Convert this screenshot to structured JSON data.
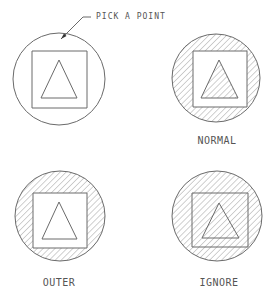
{
  "callout": {
    "text": "PICK A POINT",
    "leader": {
      "text_anchor": [
        96,
        19
      ],
      "elbow": [
        83,
        17
      ],
      "start": [
        91,
        17
      ],
      "tip": [
        61,
        39
      ]
    }
  },
  "panels": [
    {
      "id": "pick",
      "label": "",
      "circle": {
        "cx": 59,
        "cy": 79,
        "r": 46
      },
      "square": {
        "x": 32,
        "y": 51,
        "w": 55,
        "h": 57
      },
      "triangle": [
        [
          59,
          60
        ],
        [
          41,
          98
        ],
        [
          77,
          98
        ]
      ],
      "hatch": "none"
    },
    {
      "id": "normal",
      "label": "NORMAL",
      "label_pos": [
        217,
        144
      ],
      "circle": {
        "cx": 216,
        "cy": 78,
        "r": 44
      },
      "square": {
        "x": 193,
        "y": 51,
        "w": 54,
        "h": 56
      },
      "triangle": [
        [
          219,
          60
        ],
        [
          201,
          98
        ],
        [
          238,
          98
        ]
      ],
      "hatch": "normal"
    },
    {
      "id": "outer",
      "label": "OUTER",
      "label_pos": [
        59,
        286
      ],
      "circle": {
        "cx": 60,
        "cy": 216,
        "r": 45
      },
      "square": {
        "x": 33,
        "y": 193,
        "w": 54,
        "h": 55
      },
      "triangle": [
        [
          59,
          202
        ],
        [
          42,
          239
        ],
        [
          77,
          239
        ]
      ],
      "hatch": "outer"
    },
    {
      "id": "ignore",
      "label": "IGNORE",
      "label_pos": [
        219,
        286
      ],
      "circle": {
        "cx": 217,
        "cy": 216,
        "r": 45
      },
      "square": {
        "x": 192,
        "y": 193,
        "w": 56,
        "h": 54
      },
      "triangle": [
        [
          219,
          203
        ],
        [
          202,
          238
        ],
        [
          239,
          238
        ]
      ],
      "hatch": "ignore"
    }
  ],
  "style": {
    "line_color": "#6a6a6a",
    "hatch_color": "#8a8a8a",
    "text_color": "#555555",
    "hatch_angle_deg": 45,
    "hatch_spacing_px": 4.2
  }
}
